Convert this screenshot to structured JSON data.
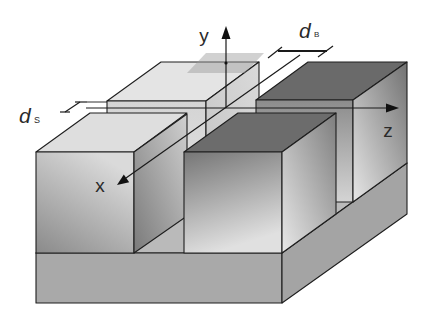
{
  "figure": {
    "axes": {
      "x": {
        "label": "x"
      },
      "y": {
        "label": "y"
      },
      "z": {
        "label": "z"
      }
    },
    "dimensions": {
      "gap_back": {
        "symbol": "d",
        "subscript": "B"
      },
      "gap_side": {
        "symbol": "d",
        "subscript": "S"
      }
    },
    "colors": {
      "background": "#ffffff",
      "edge": "#1e1e1e",
      "base_front": "#a9a9a9",
      "base_right": "#a4a4a4",
      "base_top": "#bababa",
      "front_left_top": "#dedede",
      "front_left_front_top": "#dadada",
      "front_left_front_bottom": "#8a8a8a",
      "front_left_right_top": "#d0d0d0",
      "front_left_right_bottom": "#7a7a7a",
      "front_right_top": "#6c6c6c",
      "front_right_front_top": "#767676",
      "front_right_front_bottom": "#e0e0e0",
      "front_right_right_top": "#7e7e7e",
      "front_right_right_bottom": "#e8e8e8",
      "back_left_top": "#e4e4e4",
      "back_left_front_top": "#d4d4d4",
      "back_left_front_bottom": "#e2e2e2",
      "back_left_right_top": "#dadada",
      "back_left_right_bottom": "#c4c4c4",
      "back_right_top": "#6a6a6a",
      "back_right_front_top": "#8c8c8c",
      "back_right_front_bottom": "#d4d4d4",
      "back_right_right_top": "#727272",
      "back_right_right_bottom": "#e6e6e6",
      "cross_section_plane": "#9a9a9a"
    }
  }
}
